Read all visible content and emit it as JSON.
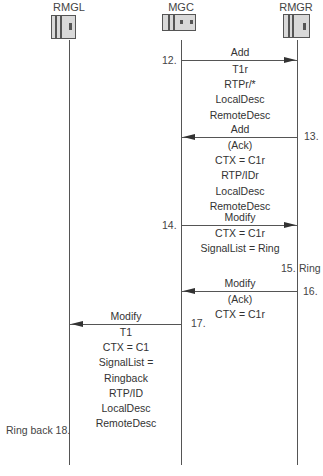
{
  "entities": [
    {
      "name": "RMGL",
      "x": 69
    },
    {
      "name": "MGC",
      "x": 181
    },
    {
      "name": "RMGR",
      "x": 297
    }
  ],
  "messages": [
    {
      "step": "12.",
      "name": "Add",
      "direction": "right",
      "from": "MGC",
      "to": "RMGR",
      "params": [
        "T1r",
        "RTPr/*",
        "LocalDesc",
        "RemoteDesc"
      ]
    },
    {
      "step": "13.",
      "name": "Add",
      "direction": "left",
      "from": "RMGR",
      "to": "MGC",
      "params": [
        "(Ack)",
        "CTX = C1r",
        "RTP/IDr",
        "LocalDesc",
        "RemoteDesc"
      ]
    },
    {
      "step": "14.",
      "name": "Modify",
      "direction": "right",
      "from": "MGC",
      "to": "RMGR",
      "params": [
        "CTX = C1r",
        "SignalList = Ring"
      ]
    },
    {
      "step": "16.",
      "name": "Modify",
      "direction": "left",
      "from": "RMGR",
      "to": "MGC",
      "params": [
        "(Ack)",
        "CTX = C1r"
      ]
    },
    {
      "step": "17.",
      "name": "Modify",
      "direction": "left",
      "from": "MGC",
      "to": "RMGL",
      "params": [
        "T1",
        "CTX = C1",
        "SignalList =",
        "Ringback",
        "RTP/ID",
        "LocalDesc",
        "RemoteDesc"
      ]
    }
  ],
  "events": [
    {
      "step": "15.",
      "label": "Ring",
      "entity": "RMGR"
    },
    {
      "text": "Ring back 18.",
      "entity": "RMGL"
    }
  ],
  "colors": {
    "line": "#555555",
    "device_fill": "#d9d9d9",
    "text": "#333333"
  }
}
